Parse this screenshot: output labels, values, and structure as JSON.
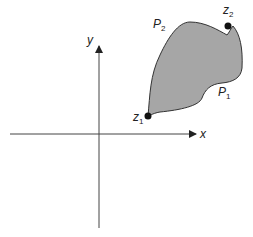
{
  "diagram": {
    "axes": {
      "x_label": "x",
      "y_label": "y"
    },
    "region": {
      "fill": "#a6a6a6",
      "stroke": "#333333"
    },
    "points": [
      {
        "name": "z",
        "sub": "1"
      },
      {
        "name": "z",
        "sub": "2"
      }
    ],
    "paths": [
      {
        "name": "P",
        "sub": "1"
      },
      {
        "name": "P",
        "sub": "2"
      }
    ]
  }
}
